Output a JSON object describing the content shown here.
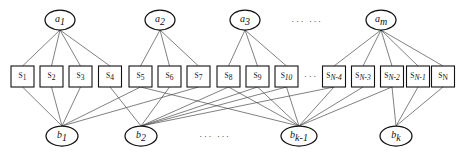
{
  "figure": {
    "type": "tripartite-graph",
    "background_color": "#ffffff",
    "node_stroke_color": "#111111",
    "edge_color": "#4a4a4a"
  },
  "layers": {
    "top": {
      "name": "a-layer",
      "shape": "ellipse",
      "nodes": [
        {
          "id": "a1",
          "base": "a",
          "sub": "1",
          "cx": 60,
          "cy": 20,
          "rx": 15,
          "ry": 10
        },
        {
          "id": "a2",
          "base": "a",
          "sub": "2",
          "cx": 160,
          "cy": 20,
          "rx": 15,
          "ry": 10
        },
        {
          "id": "a3",
          "base": "a",
          "sub": "3",
          "cx": 245,
          "cy": 20,
          "rx": 15,
          "ry": 10
        },
        {
          "id": "am",
          "base": "a",
          "sub": "m",
          "cx": 381,
          "cy": 20,
          "rx": 15,
          "ry": 10
        }
      ],
      "ellipsis": {
        "text": "··· ···",
        "x": 307,
        "y": 22
      }
    },
    "middle": {
      "name": "s-layer",
      "shape": "rect",
      "box_width": 23,
      "box_height": 21,
      "box_top": 66,
      "nodes": [
        {
          "id": "s1",
          "base": "S",
          "sub": "1",
          "cx": 22.5
        },
        {
          "id": "s2",
          "base": "S",
          "sub": "2",
          "cx": 51.5
        },
        {
          "id": "s3",
          "base": "S",
          "sub": "3",
          "cx": 80.5
        },
        {
          "id": "s4",
          "base": "S",
          "sub": "4",
          "cx": 110.0
        },
        {
          "id": "s5",
          "base": "S",
          "sub": "5",
          "cx": 140.5
        },
        {
          "id": "s6",
          "base": "S",
          "sub": "6",
          "cx": 169.5
        },
        {
          "id": "s7",
          "base": "S",
          "sub": "7",
          "cx": 198.5
        },
        {
          "id": "s8",
          "base": "S",
          "sub": "8",
          "cx": 228.5
        },
        {
          "id": "s9",
          "base": "S",
          "sub": "9",
          "cx": 257.5
        },
        {
          "id": "s10",
          "base": "S",
          "sub": "10",
          "cx": 286.5
        },
        {
          "id": "sN-4",
          "base": "S",
          "sub": "N-4",
          "cx": 334.0
        },
        {
          "id": "sN-3",
          "base": "S",
          "sub": "N-3",
          "cx": 363.0
        },
        {
          "id": "sN-2",
          "base": "S",
          "sub": "N-2",
          "cx": 392.0
        },
        {
          "id": "sN-1",
          "base": "S",
          "sub": "N-1",
          "cx": 418.0
        },
        {
          "id": "sN",
          "base": "S",
          "sub": "N",
          "cx": 443.0
        }
      ],
      "ellipsis": {
        "text": "···",
        "x": 311,
        "y": 77
      }
    },
    "bottom": {
      "name": "b-layer",
      "shape": "ellipse",
      "nodes": [
        {
          "id": "b1",
          "base": "b",
          "sub": "1",
          "cx": 62,
          "cy": 136,
          "rx": 16,
          "ry": 10
        },
        {
          "id": "b2",
          "base": "b",
          "sub": "2",
          "cx": 141,
          "cy": 136,
          "rx": 16,
          "ry": 10
        },
        {
          "id": "bk1",
          "base": "b",
          "sub": "k-1",
          "cx": 299,
          "cy": 136,
          "rx": 18,
          "ry": 10
        },
        {
          "id": "bk",
          "base": "b",
          "sub": "k",
          "cx": 396,
          "cy": 136,
          "rx": 16,
          "ry": 10
        }
      ],
      "ellipsis": {
        "text": "··· ···",
        "x": 215,
        "y": 137
      }
    }
  },
  "edges": {
    "a_to_s": [
      {
        "from": "a1",
        "to": "s1"
      },
      {
        "from": "a1",
        "to": "s2"
      },
      {
        "from": "a1",
        "to": "s3"
      },
      {
        "from": "a1",
        "to": "s4"
      },
      {
        "from": "a2",
        "to": "s5"
      },
      {
        "from": "a2",
        "to": "s6"
      },
      {
        "from": "a2",
        "to": "s7"
      },
      {
        "from": "a3",
        "to": "s8"
      },
      {
        "from": "a3",
        "to": "s9"
      },
      {
        "from": "a3",
        "to": "s10"
      },
      {
        "from": "am",
        "to": "sN-4"
      },
      {
        "from": "am",
        "to": "sN-3"
      },
      {
        "from": "am",
        "to": "sN-2"
      },
      {
        "from": "am",
        "to": "sN-1"
      },
      {
        "from": "am",
        "to": "sN"
      }
    ],
    "s_to_b": [
      {
        "from": "s1",
        "to": "b1"
      },
      {
        "from": "s2",
        "to": "b1"
      },
      {
        "from": "s3",
        "to": "b1"
      },
      {
        "from": "s4",
        "to": "b2"
      },
      {
        "from": "s5",
        "to": "b1"
      },
      {
        "from": "s6",
        "to": "b2"
      },
      {
        "from": "s7",
        "to": "b1"
      },
      {
        "from": "s8",
        "to": "b2"
      },
      {
        "from": "s9",
        "to": "bk1"
      },
      {
        "from": "s10",
        "to": "b2"
      },
      {
        "from": "s5",
        "to": "bk1"
      },
      {
        "from": "s9",
        "to": "b2"
      },
      {
        "from": "sN-4",
        "to": "b2"
      },
      {
        "from": "sN-3",
        "to": "bk1"
      },
      {
        "from": "sN-2",
        "to": "bk1"
      },
      {
        "from": "sN-1",
        "to": "bk"
      },
      {
        "from": "sN",
        "to": "bk"
      },
      {
        "from": "sN-2",
        "to": "bk"
      },
      {
        "from": "sN-4",
        "to": "bk1"
      },
      {
        "from": "s10",
        "to": "bk1"
      },
      {
        "from": "s8",
        "to": "bk1"
      }
    ]
  }
}
